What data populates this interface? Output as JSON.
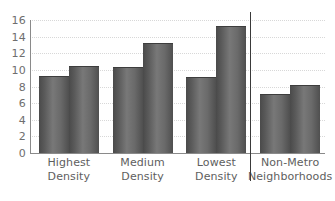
{
  "chart_data": {
    "type": "bar",
    "title": "",
    "subtitle": "",
    "xlabel": "",
    "ylabel": "",
    "categories": [
      "Highest Density",
      "Medium Density",
      "Lowest Density",
      "Non-Metro Neighborhoods"
    ],
    "category_lines": [
      [
        "Highest",
        "Density"
      ],
      [
        "Medium",
        "Density"
      ],
      [
        "Lowest",
        "Density"
      ],
      [
        "Non-Metro",
        "Neighborhoods"
      ]
    ],
    "series": [
      {
        "name": "Series 1",
        "values": [
          9.2,
          10.2,
          9.0,
          7.0
        ]
      },
      {
        "name": "Series 2",
        "values": [
          10.4,
          13.1,
          15.2,
          8.1
        ]
      }
    ],
    "ylim": [
      0,
      16
    ],
    "yticks": [
      0,
      2,
      4,
      6,
      8,
      10,
      12,
      14,
      16
    ],
    "ytick_labels": [
      "0",
      "2",
      "4",
      "6",
      "8",
      "10",
      "12",
      "14",
      "16"
    ],
    "grid": true,
    "grid_style": "dotted",
    "legend": false,
    "legend_position": "none",
    "annotations": [
      {
        "name": "metro-nonmetro-divider",
        "kind": "vertical-line",
        "after_category": "Lowest Density"
      }
    ],
    "colors": {
      "bar_dark": "#4a4a4a",
      "bar_light": "#787878",
      "gridline": "#d8d8d8",
      "axis": "#8a8a8a",
      "divider": "#3a3a3a",
      "tick_label": "#6e6e6e",
      "category_label": "#5e5e5e",
      "background": "#ffffff"
    }
  }
}
